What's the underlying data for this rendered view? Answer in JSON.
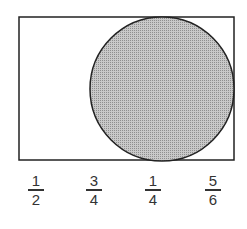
{
  "figure": {
    "rectangle": {
      "x": 19,
      "y": 17,
      "width": 215,
      "height": 143,
      "stroke": "#222222"
    },
    "circle": {
      "cx": 162,
      "cy": 89,
      "r": 72,
      "fill": "#b8b8b8",
      "stroke": "#222222"
    }
  },
  "options": [
    {
      "numerator": "1",
      "denominator": "2"
    },
    {
      "numerator": "3",
      "denominator": "4"
    },
    {
      "numerator": "1",
      "denominator": "4"
    },
    {
      "numerator": "5",
      "denominator": "6"
    }
  ]
}
